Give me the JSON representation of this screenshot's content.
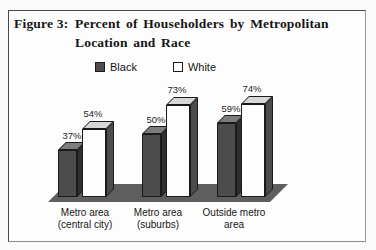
{
  "figure": {
    "label": "Figure 3:",
    "title": "Percent of Householders by Metropolitan Location and Race"
  },
  "legend": {
    "items": [
      {
        "label": "Black",
        "fill": "#4c4c4c",
        "border": "#1c1c1c"
      },
      {
        "label": "White",
        "fill": "#ffffff",
        "border": "#1c1c1c"
      }
    ]
  },
  "chart_data": {
    "type": "bar",
    "style": "3d-clustered-column",
    "title": "Percent of Householders by Metropolitan Location and Race",
    "categories": [
      "Metro area (central city)",
      "Metro area (suburbs)",
      "Outside metro area"
    ],
    "categories_display": [
      "Metro area\n(central city)",
      "Metro area\n(suburbs)",
      "Outside metro\narea"
    ],
    "series": [
      {
        "name": "Black",
        "values": [
          37,
          50,
          59
        ],
        "faces": {
          "front": "#4c4c4c",
          "top": "#7d7d7d",
          "side": "#2f2f2f"
        }
      },
      {
        "name": "White",
        "values": [
          54,
          73,
          74
        ],
        "faces": {
          "front": "#fdfdfd",
          "top": "#d7d7d7",
          "side": "#4c4c4c"
        }
      }
    ],
    "value_labels": [
      [
        "37%",
        "54%"
      ],
      [
        "50%",
        "73%"
      ],
      [
        "59%",
        "74%"
      ]
    ],
    "unit": "%",
    "ylim": [
      0,
      80
    ],
    "axes_visible": false,
    "gridlines": false,
    "legend_position": "top",
    "floor_color": "#5e5e5e"
  }
}
